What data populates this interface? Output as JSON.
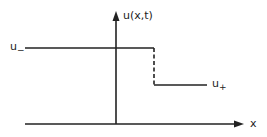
{
  "diagram": {
    "type": "step-function-shock",
    "y_axis_label": "u(x,t)",
    "x_axis_label": "x",
    "left_state": {
      "symbol": "u",
      "subscript": "−"
    },
    "right_state": {
      "symbol": "u",
      "subscript": "+"
    },
    "colors": {
      "stroke": "#222222",
      "background": "#ffffff"
    }
  }
}
